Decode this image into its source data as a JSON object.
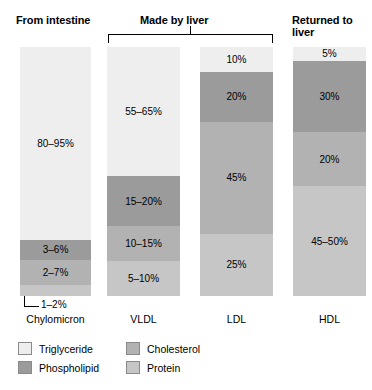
{
  "headers": {
    "intestine": "From intestine",
    "liver": "Made by liver",
    "returned_line1": "Returned to",
    "returned_line2": "liver"
  },
  "callout": {
    "label": "1–2%"
  },
  "legend": {
    "items": [
      {
        "label": "Triglyceride",
        "color": "#eeeeee"
      },
      {
        "label": "Phospholipid",
        "color": "#9b9b9b"
      },
      {
        "label": "Cholesterol",
        "color": "#b2b2b2"
      },
      {
        "label": "Protein",
        "color": "#c6c6c6"
      }
    ]
  },
  "colors": {
    "triglyceride": "#eeeeee",
    "phospholipid": "#9b9b9b",
    "cholesterol": "#b2b2b2",
    "protein": "#c6c6c6",
    "axis": "#000000",
    "background": "#ffffff"
  },
  "chart_data": {
    "type": "bar",
    "subtype": "stacked-bar",
    "title": "",
    "xlabel": "",
    "ylabel": "",
    "ylim": [
      0,
      100
    ],
    "grid": false,
    "legend_position": "bottom-left",
    "orientation": "vertical",
    "stack_order_top_to_bottom": [
      "Triglyceride",
      "Phospholipid",
      "Cholesterol",
      "Protein"
    ],
    "categories": [
      "Chylomicron",
      "VLDL",
      "LDL",
      "HDL"
    ],
    "category_groups": [
      {
        "label": "From intestine",
        "categories": [
          "Chylomicron"
        ]
      },
      {
        "label": "Made by liver",
        "categories": [
          "VLDL",
          "LDL"
        ]
      },
      {
        "label": "Returned to liver",
        "categories": [
          "HDL"
        ]
      }
    ],
    "series": [
      {
        "name": "Triglyceride",
        "color": "#eeeeee",
        "values": [
          88,
          60,
          10,
          5
        ],
        "labels": [
          "80–95%",
          "55–65%",
          "10%",
          "5%"
        ]
      },
      {
        "name": "Phospholipid",
        "color": "#9b9b9b",
        "values": [
          4.5,
          17.5,
          20,
          30
        ],
        "labels": [
          "3–6%",
          "15–20%",
          "20%",
          "30%"
        ]
      },
      {
        "name": "Cholesterol",
        "color": "#b2b2b2",
        "values": [
          4.5,
          12.5,
          45,
          20
        ],
        "labels": [
          "2–7%",
          "10–15%",
          "45%",
          "20%"
        ]
      },
      {
        "name": "Protein",
        "color": "#c6c6c6",
        "values": [
          1.5,
          7.5,
          25,
          47.5
        ],
        "labels": [
          "1–2%",
          "5–10%",
          "25%",
          "45–50%"
        ]
      }
    ],
    "bars": [
      {
        "category": "Chylomicron",
        "segments": [
          {
            "component": "Triglyceride",
            "label": "80–95%",
            "color": "#eeeeee",
            "height_pct": 77.5,
            "label_visible": true
          },
          {
            "component": "Phospholipid",
            "label": "3–6%",
            "color": "#9b9b9b",
            "height_pct": 8.0,
            "label_visible": true
          },
          {
            "component": "Cholesterol",
            "label": "2–7%",
            "color": "#b2b2b2",
            "height_pct": 10.0,
            "label_visible": true
          },
          {
            "component": "Protein",
            "label": "1–2%",
            "color": "#c6c6c6",
            "height_pct": 4.5,
            "label_visible": false
          }
        ]
      },
      {
        "category": "VLDL",
        "segments": [
          {
            "component": "Triglyceride",
            "label": "55–65%",
            "color": "#eeeeee",
            "height_pct": 52.0,
            "label_visible": true
          },
          {
            "component": "Phospholipid",
            "label": "15–20%",
            "color": "#9b9b9b",
            "height_pct": 20.0,
            "label_visible": true
          },
          {
            "component": "Cholesterol",
            "label": "10–15%",
            "color": "#b2b2b2",
            "height_pct": 14.0,
            "label_visible": true
          },
          {
            "component": "Protein",
            "label": "5–10%",
            "color": "#c6c6c6",
            "height_pct": 14.0,
            "label_visible": true
          }
        ]
      },
      {
        "category": "LDL",
        "segments": [
          {
            "component": "Triglyceride",
            "label": "10%",
            "color": "#eeeeee",
            "height_pct": 10.0,
            "label_visible": true
          },
          {
            "component": "Phospholipid",
            "label": "20%",
            "color": "#9b9b9b",
            "height_pct": 20.0,
            "label_visible": true
          },
          {
            "component": "Cholesterol",
            "label": "45%",
            "color": "#b2b2b2",
            "height_pct": 45.0,
            "label_visible": true
          },
          {
            "component": "Protein",
            "label": "25%",
            "color": "#c6c6c6",
            "height_pct": 25.0,
            "label_visible": true
          }
        ]
      },
      {
        "category": "HDL",
        "segments": [
          {
            "component": "Triglyceride",
            "label": "5%",
            "color": "#eeeeee",
            "height_pct": 5.5,
            "label_visible": true
          },
          {
            "component": "Phospholipid",
            "label": "30%",
            "color": "#9b9b9b",
            "height_pct": 28.5,
            "label_visible": true
          },
          {
            "component": "Cholesterol",
            "label": "20%",
            "color": "#b2b2b2",
            "height_pct": 22.0,
            "label_visible": true
          },
          {
            "component": "Protein",
            "label": "45–50%",
            "color": "#c6c6c6",
            "height_pct": 44.0,
            "label_visible": true
          }
        ]
      }
    ]
  }
}
